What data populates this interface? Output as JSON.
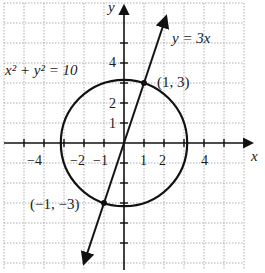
{
  "diagram": {
    "axes": {
      "x_label": "x",
      "y_label": "y",
      "x_ticks": [
        {
          "value": -4,
          "label": "−4"
        },
        {
          "value": -2,
          "label": "−2"
        },
        {
          "value": -1,
          "label": "−1"
        },
        {
          "value": 1,
          "label": "1"
        },
        {
          "value": 2,
          "label": "2"
        },
        {
          "value": 4,
          "label": "4"
        }
      ],
      "y_ticks": [
        {
          "value": 1,
          "label": "1"
        },
        {
          "value": 2,
          "label": "2"
        },
        {
          "value": 4,
          "label": "4"
        }
      ]
    },
    "curves": {
      "circle": {
        "equation_label": "x² + y² = 10",
        "center": [
          0,
          0
        ],
        "radius_squared": 10
      },
      "line": {
        "equation_label": "y = 3x",
        "slope": 3
      }
    },
    "points": [
      {
        "label": "(1, 3)",
        "x": 1,
        "y": 3
      },
      {
        "label": "(−1, −3)",
        "x": -1,
        "y": -3
      }
    ]
  }
}
